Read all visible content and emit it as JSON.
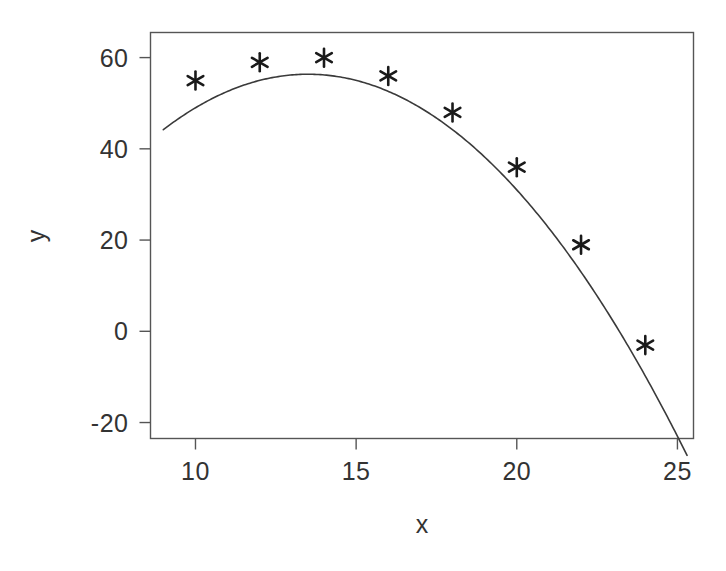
{
  "chart_data": {
    "type": "scatter",
    "title": "",
    "xlabel": "x",
    "ylabel": "y",
    "xlim": [
      8.6,
      25.5
    ],
    "ylim": [
      -23.5,
      65.5
    ],
    "xticks": [
      10,
      15,
      20,
      25
    ],
    "xtick_labels": [
      "10",
      "15",
      "20",
      "25"
    ],
    "yticks": [
      60,
      40,
      20,
      0,
      -20
    ],
    "ytick_labels": [
      "60",
      "40",
      "20",
      "0",
      "-20"
    ],
    "grid": false,
    "legend": null,
    "box": true,
    "marker": "asterisk",
    "marker_color": "#1a1a1a",
    "line_color": "#3a3a3a",
    "axis_color": "#555555",
    "background": "#ffffff",
    "x": [
      10,
      12,
      14,
      16,
      18,
      20,
      22,
      24
    ],
    "values": [
      53,
      57,
      58,
      54,
      46,
      34,
      17,
      -5
    ],
    "series": [
      {
        "name": "observed",
        "type": "scatter",
        "x": [
          10,
          12,
          14,
          16,
          18,
          20,
          22,
          24
        ],
        "values": [
          53,
          57,
          58,
          54,
          46,
          34,
          17,
          -5
        ]
      },
      {
        "name": "fitted quadratic",
        "type": "line",
        "equation": "y = -0.6x^2 + 16.2x - 53.0",
        "x_start": 9.0,
        "x_end": 25.3,
        "coefficients": [
          -0.6,
          16.2,
          -53.0
        ]
      }
    ]
  },
  "axes": {
    "x_title": "x",
    "y_title": "y"
  }
}
